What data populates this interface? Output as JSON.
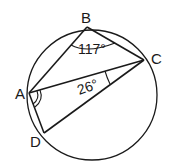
{
  "diagram": {
    "type": "cyclic-quadrilateral",
    "points": {
      "A": {
        "label": "A"
      },
      "B": {
        "label": "B"
      },
      "C": {
        "label": "C"
      },
      "D": {
        "label": "D"
      }
    },
    "segments": [
      "AB",
      "BC",
      "CD",
      "DA",
      "AC"
    ],
    "angles": [
      {
        "vertex": "B",
        "between": [
          "A",
          "C"
        ],
        "label": "117°"
      },
      {
        "vertex": "C",
        "between": [
          "A",
          "D"
        ],
        "label": "26°"
      },
      {
        "vertex": "A",
        "between": [
          "C",
          "D"
        ],
        "label": "",
        "marker": "double-arc"
      }
    ],
    "stroke_color": "#1a1a1a",
    "background": "#ffffff"
  }
}
